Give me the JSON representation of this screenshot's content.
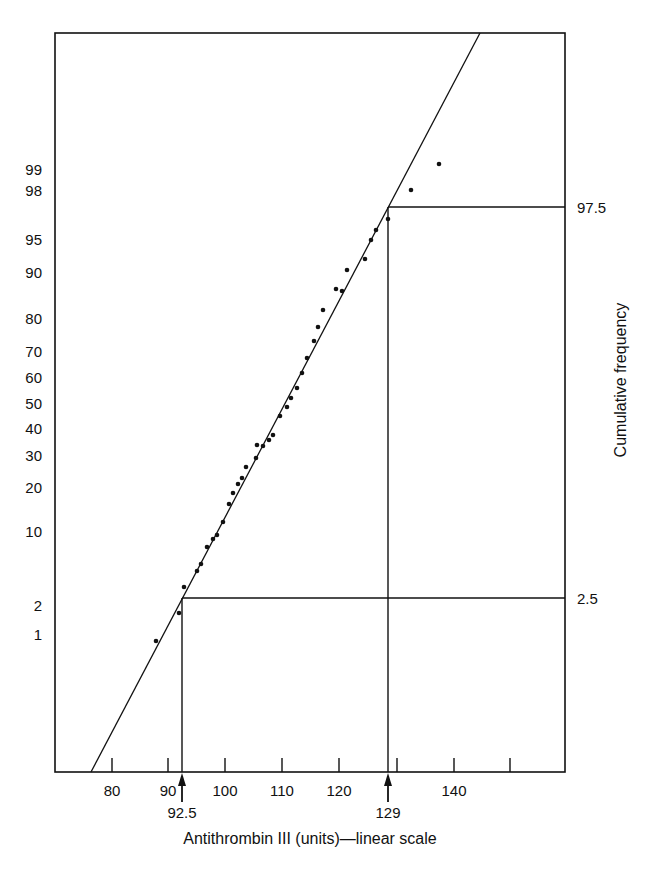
{
  "chart_data": {
    "type": "scatter",
    "subtype": "probability-plot",
    "title": "",
    "xlabel": "Antithrombin III (units)—linear scale",
    "ylabel": "Cumulative frequency",
    "x_scale": "linear",
    "y_scale": "normal-probability",
    "xlim": [
      72,
      155
    ],
    "x_ticks": [
      80,
      90,
      100,
      110,
      120,
      130,
      140,
      150
    ],
    "x_tick_labels": [
      "80",
      "90",
      "100",
      "110",
      "120",
      "",
      "140",
      ""
    ],
    "y_tick_labels": [
      "99",
      "98",
      "95",
      "90",
      "80",
      "70",
      "60",
      "50",
      "40",
      "30",
      "20",
      "10",
      "2",
      "1"
    ],
    "grid": false,
    "legend": null,
    "series": [
      {
        "name": "observations",
        "type": "scatter",
        "points": [
          [
            87.7,
            0.9
          ],
          [
            91.8,
            1.8
          ],
          [
            92.6,
            3
          ],
          [
            94.9,
            4.5
          ],
          [
            95.6,
            5.5
          ],
          [
            96.7,
            8
          ],
          [
            97.7,
            9
          ],
          [
            98.4,
            10
          ],
          [
            99.5,
            12
          ],
          [
            100.5,
            16
          ],
          [
            101.2,
            19
          ],
          [
            102.1,
            22
          ],
          [
            102.8,
            24
          ],
          [
            103.5,
            27
          ],
          [
            105.3,
            30
          ],
          [
            105.4,
            35
          ],
          [
            106.5,
            35
          ],
          [
            107.5,
            37
          ],
          [
            108.2,
            38
          ],
          [
            109.5,
            46
          ],
          [
            110.7,
            49
          ],
          [
            111.4,
            53
          ],
          [
            112.5,
            57
          ],
          [
            113.3,
            63
          ],
          [
            114.2,
            67
          ],
          [
            115.4,
            73
          ],
          [
            116.1,
            77
          ],
          [
            117.0,
            82
          ],
          [
            119.3,
            87
          ],
          [
            120.4,
            86
          ],
          [
            121.2,
            90
          ],
          [
            124.4,
            92
          ],
          [
            125.4,
            95
          ],
          [
            126.3,
            96
          ],
          [
            128.4,
            97
          ],
          [
            132.5,
            98.5
          ],
          [
            137.4,
            99.2
          ]
        ]
      },
      {
        "name": "fitted line",
        "type": "line",
        "points": [
          [
            76.5,
            0.02
          ],
          [
            147,
            99.99
          ]
        ]
      }
    ],
    "annotations": [
      {
        "label": "2.5",
        "type": "reference-line",
        "y": 2.5,
        "x": 92.5
      },
      {
        "label": "97.5",
        "type": "reference-line",
        "y": 97.5,
        "x": 129
      },
      {
        "label": "92.5",
        "type": "arrow",
        "x": 92.5
      },
      {
        "label": "129",
        "type": "arrow",
        "x": 129
      }
    ]
  },
  "labels": {
    "x_axis_title": "Antithrombin III (units)—linear scale",
    "y_axis_title": "Cumulative frequency",
    "ref_low": "2.5",
    "ref_high": "97.5",
    "arrow_low": "92.5",
    "arrow_high": "129"
  },
  "layout": {
    "frame": {
      "left": 55,
      "top": 33,
      "right": 565,
      "bottom": 772
    },
    "x_px": {
      "80": 112,
      "90": 168,
      "100": 225,
      "110": 282,
      "120": 339,
      "130": 397,
      "140": 454,
      "150": 510
    },
    "y_px": {
      "99": 170,
      "98": 191,
      "95": 240,
      "90": 273,
      "80": 319,
      "70": 352,
      "60": 378,
      "50": 404,
      "40": 429,
      "30": 456,
      "20": 488,
      "10": 532,
      "2": 606,
      "1": 635
    },
    "ref_low_px": {
      "x": 182,
      "y": 598
    },
    "ref_high_px": {
      "x": 388,
      "y": 207
    },
    "fit_line_px": [
      [
        91,
        772
      ],
      [
        480,
        33
      ]
    ],
    "points_px": [
      [
        156,
        641
      ],
      [
        179,
        613
      ],
      [
        184,
        587
      ],
      [
        197,
        571
      ],
      [
        201,
        564
      ],
      [
        207,
        547
      ],
      [
        213,
        539
      ],
      [
        217,
        535
      ],
      [
        223,
        522
      ],
      [
        229,
        504
      ],
      [
        233,
        493
      ],
      [
        238,
        484
      ],
      [
        242,
        478
      ],
      [
        246,
        467
      ],
      [
        256,
        458
      ],
      [
        257,
        445
      ],
      [
        263,
        446
      ],
      [
        269,
        440
      ],
      [
        273,
        435
      ],
      [
        280,
        416
      ],
      [
        287,
        407
      ],
      [
        291,
        398
      ],
      [
        297,
        388
      ],
      [
        302,
        373
      ],
      [
        307,
        358
      ],
      [
        314,
        341
      ],
      [
        318,
        327
      ],
      [
        323,
        310
      ],
      [
        336,
        289
      ],
      [
        342,
        291
      ],
      [
        347,
        270
      ],
      [
        365,
        259
      ],
      [
        371,
        240
      ],
      [
        376,
        230
      ],
      [
        388,
        219
      ],
      [
        411,
        190
      ],
      [
        439,
        164
      ]
    ]
  }
}
